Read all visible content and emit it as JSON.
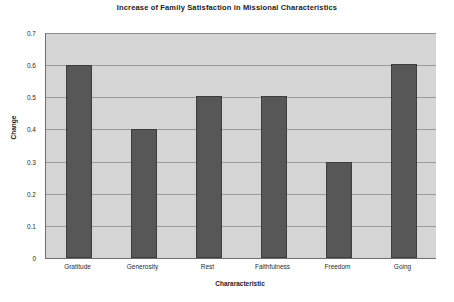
{
  "chart_data": {
    "type": "bar",
    "title": "Increase of Family Satisfaction in Missional Characteristics",
    "xlabel": "Chararacteristic",
    "ylabel": "Change",
    "categories": [
      "Gratitude",
      "Generosity",
      "Rest",
      "Faithfulness",
      "Freedom",
      "Going"
    ],
    "values": [
      0.6,
      0.4,
      0.505,
      0.505,
      0.3,
      0.605
    ],
    "ylim": [
      0,
      0.7
    ],
    "ytick_labels": [
      "0.7",
      "0.6",
      "0.5",
      "0.4",
      "0.3",
      "0.2",
      "0.1",
      "0"
    ],
    "ytick_values": [
      0.7,
      0.6,
      0.5,
      0.4,
      0.3,
      0.2,
      0.1,
      0
    ],
    "grid": "horizontal",
    "legend": "none",
    "colors": {
      "bar_fill": "#575757",
      "bar_edge": "#3d3d3d",
      "plot_background": "#d5d5d5",
      "gridline": "#9a9a9a",
      "axis_line": "#6e6e6e",
      "figure_background": "#ffffff",
      "text": "#1b1b1b"
    }
  }
}
